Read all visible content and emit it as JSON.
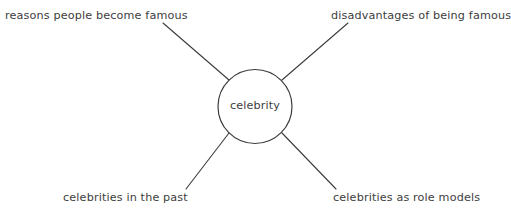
{
  "diagram": {
    "type": "mind-map",
    "title_visible": false,
    "background_color": "#ffffff",
    "stroke_color": "#3c3c3c",
    "text_color": "#3d3d3d",
    "center": {
      "label": "celebrity",
      "shape": "circle",
      "cx": 255,
      "cy": 106.5,
      "r": 37
    },
    "branches": [
      {
        "id": "top-left",
        "label": "reasons people become famous",
        "line": {
          "x1": 229,
          "y1": 80,
          "x2": 163,
          "y2": 23
        }
      },
      {
        "id": "top-right",
        "label": "disadvantages of being famous",
        "line": {
          "x1": 282,
          "y1": 80,
          "x2": 348,
          "y2": 23
        }
      },
      {
        "id": "bottom-left",
        "label": "celebrities in the past",
        "line": {
          "x1": 229,
          "y1": 133,
          "x2": 186,
          "y2": 189
        }
      },
      {
        "id": "bottom-right",
        "label": "celebrities as role models",
        "line": {
          "x1": 282,
          "y1": 133,
          "x2": 336,
          "y2": 189
        }
      }
    ]
  }
}
